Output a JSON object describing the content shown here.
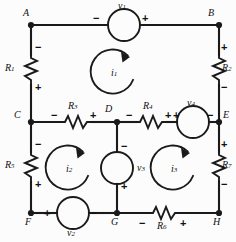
{
  "colors": {
    "wire": "#1a1a1a",
    "background": "#fcfcfc",
    "text": "#111111"
  },
  "nodes": [
    {
      "name": "node-A",
      "label": "A",
      "x": 23,
      "y": 12
    },
    {
      "name": "node-B",
      "label": "B",
      "x": 208,
      "y": 12
    },
    {
      "name": "node-C",
      "label": "C",
      "x": 12,
      "y": 113
    },
    {
      "name": "node-D",
      "label": "D",
      "x": 105,
      "y": 107
    },
    {
      "name": "node-E",
      "label": "E",
      "x": 220,
      "y": 113
    },
    {
      "name": "node-F",
      "label": "F",
      "x": 24,
      "y": 222
    },
    {
      "name": "node-G",
      "label": "G",
      "x": 117,
      "y": 222
    },
    {
      "name": "node-H",
      "label": "H",
      "x": 220,
      "y": 222
    }
  ],
  "resistors": [
    {
      "name": "resistor-r1",
      "label": "R",
      "sub": "1",
      "plus": "+",
      "minus": "−",
      "orientation": "vertical",
      "label_side": "left",
      "minus_at": "top",
      "plus_at": "bottom"
    },
    {
      "name": "resistor-r2",
      "label": "R",
      "sub": "2",
      "plus": "+",
      "minus": "−",
      "orientation": "vertical",
      "label_side": "right",
      "plus_at": "top",
      "minus_at": "bottom"
    },
    {
      "name": "resistor-r3",
      "label": "R",
      "sub": "3",
      "plus": "+",
      "minus": "−",
      "orientation": "horizontal",
      "label_side": "top",
      "minus_at": "left",
      "plus_at": "right"
    },
    {
      "name": "resistor-r4",
      "label": "R",
      "sub": "4",
      "plus": "+",
      "minus": "−",
      "orientation": "horizontal",
      "label_side": "top",
      "minus_at": "left",
      "plus_at": "right"
    },
    {
      "name": "resistor-r5",
      "label": "R",
      "sub": "5",
      "plus": "+",
      "minus": "−",
      "orientation": "vertical",
      "label_side": "left",
      "minus_at": "top",
      "plus_at": "bottom"
    },
    {
      "name": "resistor-r6",
      "label": "R",
      "sub": "6",
      "plus": "+",
      "minus": "−",
      "orientation": "horizontal",
      "label_side": "bottom",
      "minus_at": "left",
      "plus_at": "right"
    },
    {
      "name": "resistor-r7",
      "label": "R",
      "sub": "7",
      "plus": "+",
      "minus": "−",
      "orientation": "vertical",
      "label_side": "right",
      "plus_at": "top",
      "minus_at": "bottom"
    }
  ],
  "sources": [
    {
      "name": "source-v1",
      "label": "v",
      "sub": "1",
      "plus": "+",
      "minus": "−",
      "orientation": "horizontal",
      "label_side": "top",
      "minus_at": "left",
      "plus_at": "right"
    },
    {
      "name": "source-v2",
      "label": "v",
      "sub": "2",
      "plus": "+",
      "minus": "−",
      "orientation": "horizontal",
      "label_side": "bottom",
      "plus_at": "left",
      "minus_at": "right"
    },
    {
      "name": "source-v3",
      "label": "v",
      "sub": "3",
      "plus": "+",
      "minus": "−",
      "orientation": "vertical",
      "label_side": "right",
      "minus_at": "top",
      "plus_at": "bottom"
    },
    {
      "name": "source-v4",
      "label": "v",
      "sub": "4",
      "plus": "+",
      "minus": "−",
      "orientation": "horizontal",
      "label_side": "top",
      "plus_at": "left",
      "minus_at": "right"
    }
  ],
  "mesh_currents": [
    {
      "name": "mesh-current-i1",
      "label": "i",
      "sub": "1",
      "direction": "clockwise",
      "cx": 115,
      "cy": 73,
      "r": 22
    },
    {
      "name": "mesh-current-i2",
      "label": "i",
      "sub": "2",
      "direction": "clockwise",
      "cx": 70,
      "cy": 169,
      "r": 22
    },
    {
      "name": "mesh-current-i3",
      "label": "i",
      "sub": "3",
      "direction": "clockwise",
      "cx": 175,
      "cy": 169,
      "r": 22
    }
  ],
  "labels": {
    "A": "A",
    "B": "B",
    "C": "C",
    "D": "D",
    "E": "E",
    "F": "F",
    "G": "G",
    "H": "H",
    "R1": "R",
    "R2": "R",
    "R3": "R",
    "R4": "R",
    "R5": "R",
    "R6": "R",
    "R7": "R",
    "v1": "v",
    "v2": "v",
    "v3": "v",
    "v4": "v",
    "i1": "i",
    "i2": "i",
    "i3": "i",
    "s1": "1",
    "s2": "2",
    "s3": "3",
    "s4": "4",
    "s5": "5",
    "s6": "6",
    "s7": "7",
    "plus": "+",
    "minus": "−"
  }
}
